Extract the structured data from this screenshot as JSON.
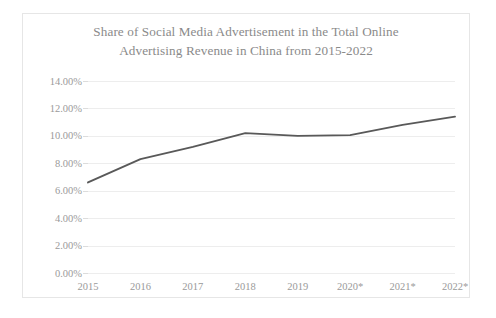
{
  "chart_data": {
    "type": "line",
    "title": "Share of Social Media Advertisement in the Total Online Advertising Revenue in China from 2015-2022",
    "title_lines": [
      "Share of Social Media Advertisement in the Total Online",
      "Advertising Revenue in China from 2015-2022"
    ],
    "xlabel": "",
    "ylabel": "",
    "categories": [
      "2015",
      "2016",
      "2017",
      "2018",
      "2019",
      "2020*",
      "2021*",
      "2022*"
    ],
    "values": [
      6.6,
      8.3,
      9.2,
      10.2,
      10.0,
      10.05,
      10.8,
      11.4
    ],
    "value_labels": [
      "6.60%",
      "8.30%",
      "9.20%",
      "10.20%",
      "10.00%",
      "10.05%",
      "10.80%",
      "11.40%"
    ],
    "ylim": [
      0,
      14
    ],
    "ytick_values": [
      0,
      2,
      4,
      6,
      8,
      10,
      12,
      14
    ],
    "ytick_labels": [
      "0.00%",
      "2.00%",
      "4.00%",
      "6.00%",
      "8.00%",
      "10.00%",
      "12.00%",
      "14.00%"
    ],
    "grid": true,
    "legend": false,
    "legend_position": "none",
    "series_name": "Share of social media advertisement",
    "series_color": "#595959",
    "gridline_color": "#ededed",
    "text_color": "#9a9a9a",
    "background_color": "#ffffff",
    "note": "Values for 2020*, 2021* and 2022* are marked with an asterisk (forecast)."
  }
}
